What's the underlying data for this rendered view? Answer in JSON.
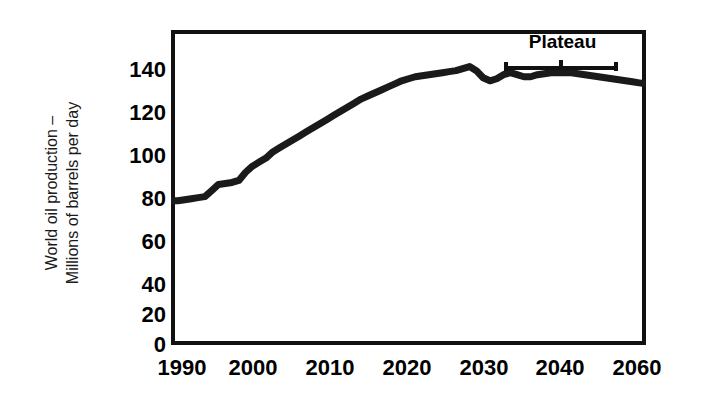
{
  "chart_data": {
    "type": "line",
    "title": "",
    "subtitle": "",
    "xlabel": "",
    "ylabel": "World oil production – Millions of barrels per day",
    "ylabel_lines": [
      "World oil production –",
      "Millions of barrels per day"
    ],
    "xlim": [
      1990,
      2060
    ],
    "ylim": [
      0,
      155
    ],
    "grid": false,
    "legend": false,
    "legend_position": "none",
    "line_color": "#1a1a1a",
    "line_width_px": 7,
    "frame_color": "#111111",
    "background_color": "#ffffff",
    "y_ticks": [
      0,
      20,
      40,
      60,
      80,
      100,
      120,
      140
    ],
    "y_tick_labels": [
      "0",
      "20",
      "40",
      "60",
      "80",
      "100",
      "120",
      "140"
    ],
    "x_ticks": [
      1990,
      2000,
      2010,
      2020,
      2030,
      2040,
      2060
    ],
    "x_tick_labels": [
      "1990",
      "2000",
      "2010",
      "2020",
      "2030",
      "2040",
      "2060"
    ],
    "annotations": [
      {
        "text": "Plateau",
        "type": "bracket-label",
        "x_start": 2033,
        "x_end": 2049,
        "y": 142
      }
    ],
    "series": [
      {
        "name": "World oil production",
        "x": [
          1990,
          1991,
          1992,
          1993,
          1994,
          1995,
          1996,
          1997,
          1998,
          1999,
          2000,
          2001,
          2002,
          2003,
          2004,
          2005,
          2006,
          2007,
          2008,
          2009,
          2010,
          2011,
          2012,
          2013,
          2014,
          2015,
          2016,
          2017,
          2018,
          2019,
          2020,
          2021,
          2022,
          2023,
          2024,
          2025,
          2026,
          2027,
          2028,
          2029,
          2030,
          2031,
          2032,
          2033,
          2034,
          2035,
          2036,
          2037,
          2038,
          2039,
          2040,
          2041,
          2042,
          2043,
          2044,
          2045,
          2046,
          2047,
          2048,
          2049,
          2050,
          2051,
          2052,
          2053,
          2054,
          2055,
          2056,
          2057,
          2058,
          2059,
          2060
        ],
        "y": [
          71,
          71,
          71.5,
          72,
          72.5,
          73,
          76,
          79,
          79.5,
          80,
          81,
          85,
          88,
          90,
          92,
          95,
          97,
          99,
          101,
          103,
          105,
          107,
          109,
          111,
          113,
          115,
          117,
          119,
          121,
          122.5,
          124,
          125.5,
          127,
          128.5,
          130,
          131,
          132,
          132.5,
          133,
          133.5,
          134,
          134.5,
          135,
          136,
          137,
          135,
          131.5,
          130,
          131,
          133,
          134,
          133,
          132,
          132,
          133,
          133.5,
          134,
          134,
          134,
          134,
          133.5,
          133,
          132.5,
          132,
          131.5,
          131,
          130.5,
          130,
          129.5,
          129,
          128.5
        ]
      }
    ]
  },
  "axis": {
    "y_title_line1": "World oil production –",
    "y_title_line2": "Millions of barrels per day"
  },
  "plateau": {
    "label": "Plateau"
  }
}
